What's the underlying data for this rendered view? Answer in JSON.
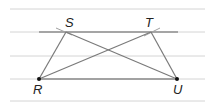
{
  "diagram": {
    "type": "geometry-parallel-lines-trapezoid",
    "points": {
      "S": {
        "label": "S",
        "x": 66,
        "y": 32
      },
      "T": {
        "label": "T",
        "x": 151,
        "y": 32
      },
      "R": {
        "label": "R",
        "x": 39,
        "y": 79
      },
      "U": {
        "label": "U",
        "x": 177,
        "y": 79
      }
    },
    "labels": {
      "S": "S",
      "T": "T",
      "R": "R",
      "U": "U"
    },
    "segments": [
      "RS",
      "ST",
      "TU",
      "RU",
      "RT",
      "SU"
    ],
    "ruled_lines_y": [
      9,
      32,
      56,
      79,
      101
    ],
    "colors": {
      "ruled_line": "#d0d0d0",
      "segment": "#8a8a8a",
      "top_line": "#9a9a9a",
      "point": "#111111"
    }
  }
}
